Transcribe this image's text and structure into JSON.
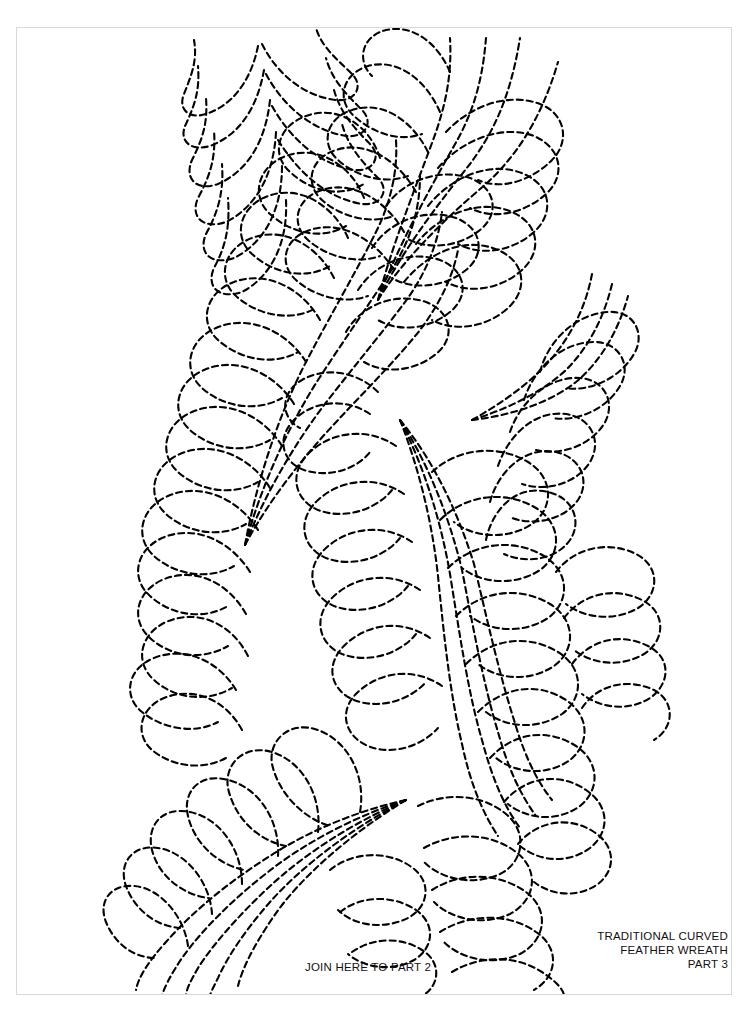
{
  "page": {
    "width": 749,
    "height": 1014,
    "background_color": "#ffffff",
    "border_color": "#d8d8d8",
    "ink_color": "#000000"
  },
  "title_block": {
    "line1": "TRADITIONAL CURVED",
    "line2": "FEATHER WREATH",
    "line3": "PART 3"
  },
  "join_note": {
    "text": "JOIN HERE TO PART 2"
  },
  "pattern": {
    "name": "traditional-curved-feather-wreath",
    "style": "dashed-stitch-line",
    "stroke_color": "#000000",
    "stroke_width": 2.1,
    "dash_pattern": "6 4",
    "description": "Dashed quilting stitch guide of curved feather plumes radiating from spine points"
  }
}
